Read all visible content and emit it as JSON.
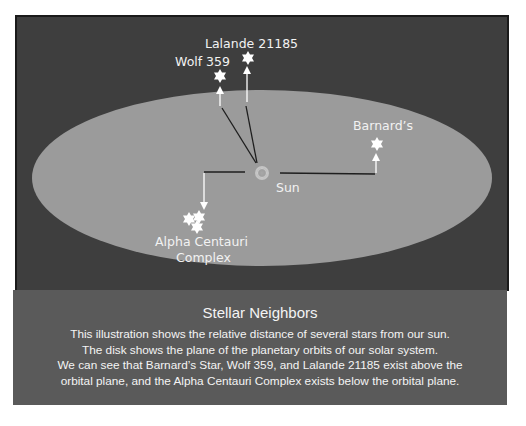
{
  "diagram": {
    "labels": {
      "lalande": "Lalande 21185",
      "wolf": "Wolf 359",
      "barnards": "Barnard’s",
      "sun": "Sun",
      "alpha_line1": "Alpha Centauri",
      "alpha_line2": "Complex"
    },
    "colors": {
      "background": "#3e3e3e",
      "disk": "#9b9b9b",
      "star": "#ffffff",
      "line": "#1e1e1e",
      "caption_bg": "#5a5a5a",
      "text": "#f2f2f2"
    }
  },
  "caption": {
    "title": "Stellar Neighbors",
    "lines": [
      "This illustration shows the relative distance of several stars from our sun.",
      "The disk shows the plane of the planetary orbits of our solar system.",
      "We can see that Barnard’s Star, Wolf 359, and Lalande 21185 exist above the",
      "orbital plane, and the Alpha Centauri Complex exists below the orbital plane."
    ]
  }
}
